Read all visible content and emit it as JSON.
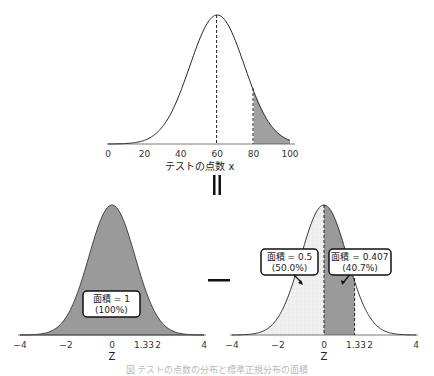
{
  "top_plot": {
    "xlabel": "テストの点数 x",
    "ticks": [
      "0",
      "20",
      "40",
      "60",
      "80",
      "100"
    ],
    "mean": 60,
    "threshold": 80
  },
  "equals_symbol": "||",
  "minus_symbol": "−",
  "left_plot": {
    "xlabel": "Z",
    "ticks": [
      "−4",
      "−2",
      "0",
      "1.33",
      "2",
      "4"
    ],
    "box_line1": "面積 = 1",
    "box_line2": "(100%)"
  },
  "right_plot": {
    "xlabel": "Z",
    "ticks": [
      "−4",
      "−2",
      "0",
      "1.33",
      "2",
      "4"
    ],
    "box_left_line1": "面積 = 0.5",
    "box_left_line2": "(50.0%)",
    "box_right_line1": "面積 = 0.407",
    "box_right_line2": "(40.7%)"
  },
  "caption": "図  テストの点数の分布と標準正規分布の面積",
  "colors": {
    "fill_dark": "#9a9a9a",
    "fill_light": "#efefef",
    "curve": "#222222"
  },
  "chart_data": [
    {
      "type": "area",
      "title": "",
      "xlabel": "テストの点数 x",
      "ylabel": "",
      "xlim": [
        0,
        100
      ],
      "x_ticks": [
        0,
        20,
        40,
        60,
        80,
        100
      ],
      "distribution": "normal",
      "mean": 60,
      "sd": 15,
      "dashed_lines_at": [
        60,
        80
      ],
      "shaded_region": [
        80,
        100
      ]
    },
    {
      "type": "area",
      "title": "",
      "xlabel": "Z",
      "xlim": [
        -4,
        4
      ],
      "x_ticks": [
        -4,
        -2,
        0,
        1.33,
        2,
        4
      ],
      "distribution": "standard normal",
      "shaded_region": [
        -4,
        4
      ],
      "annotation": "面積 = 1 (100%)"
    },
    {
      "type": "area",
      "title": "",
      "xlabel": "Z",
      "xlim": [
        -4,
        4
      ],
      "x_ticks": [
        -4,
        -2,
        0,
        1.33,
        2,
        4
      ],
      "distribution": "standard normal",
      "dashed_lines_at": [
        0,
        1.33
      ],
      "regions": [
        {
          "range": [
            -4,
            0
          ],
          "area": 0.5,
          "label": "面積 = 0.5 (50.0%)",
          "fill": "light"
        },
        {
          "range": [
            0,
            1.33
          ],
          "area": 0.407,
          "label": "面積 = 0.407 (40.7%)",
          "fill": "dark"
        }
      ]
    }
  ]
}
